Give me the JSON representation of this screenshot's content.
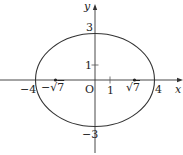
{
  "diagram": {
    "type": "ellipse",
    "equation_params": {
      "a": 4,
      "b": 3,
      "c_label": "√7"
    },
    "axes": {
      "x_label": "x",
      "y_label": "y",
      "origin_label": "O"
    },
    "x_ticks": [
      {
        "value": -4,
        "label": "−4"
      },
      {
        "value": -2.6458,
        "label": "−√7"
      },
      {
        "value": 1,
        "label": "1"
      },
      {
        "value": 2.6458,
        "label": "√7"
      },
      {
        "value": 4,
        "label": "4"
      }
    ],
    "y_ticks": [
      {
        "value": 3,
        "label": "3"
      },
      {
        "value": 1,
        "label": "1"
      },
      {
        "value": -3,
        "label": "−3"
      }
    ],
    "foci": [
      {
        "x": -2.6458,
        "y": 0,
        "label": "−√7"
      },
      {
        "x": 2.6458,
        "y": 0,
        "label": "√7"
      }
    ],
    "colors": {
      "stroke": "#333333",
      "background": "#ffffff"
    }
  },
  "labels": {
    "y_axis": "y",
    "x_axis": "x",
    "origin": "O",
    "y3": "3",
    "y1": "1",
    "yneg3": "−3",
    "xneg4": "−4",
    "xnegsqrt7_minus": "−",
    "xnegsqrt7_rad": "√",
    "xnegsqrt7_num": "7",
    "x1": "1",
    "xsqrt7_rad": "√",
    "xsqrt7_num": "7",
    "x4": "4"
  }
}
